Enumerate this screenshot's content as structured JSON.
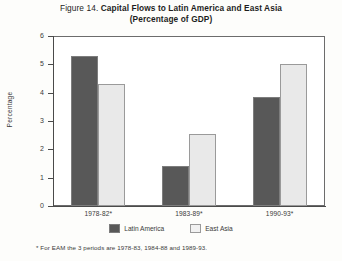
{
  "figure": {
    "number_label": "Figure 14.",
    "title_line_1": "Capital Flows to Latin America and East Asia",
    "title_line_2": "(Percentage of GDP)",
    "footnote": "* For EAM the 3 periods are 1978-83, 1984-88 and 1989-93."
  },
  "legend": {
    "position": "bottom-center",
    "items": [
      {
        "label": "Latin America",
        "color": "#585858"
      },
      {
        "label": "East Asia",
        "color": "#e9e9e9"
      }
    ]
  },
  "chart_data": {
    "type": "bar",
    "title": "Figure 14. Capital Flows to Latin America and East Asia (Percentage of GDP)",
    "subtitle": "(Percentage of GDP)",
    "categories": [
      "1978-82*",
      "1983-89*",
      "1990-93*"
    ],
    "series": [
      {
        "name": "Latin America",
        "values": [
          5.3,
          1.4,
          3.85
        ],
        "color": "#585858"
      },
      {
        "name": "East Asia",
        "values": [
          4.3,
          2.55,
          5.0
        ],
        "color": "#e9e9e9"
      }
    ],
    "xlabel": "",
    "ylabel": "Percentage",
    "ylim": [
      0,
      6
    ],
    "yticks": [
      0,
      1,
      2,
      3,
      4,
      5,
      6
    ],
    "ytick_labels": [
      "0",
      "1",
      "2",
      "3",
      "4",
      "5",
      "6"
    ],
    "grid": false,
    "legend_position": "bottom-center",
    "annotations": [
      "* For EAM the 3 periods are 1978-83, 1984-88 and 1989-93."
    ]
  }
}
